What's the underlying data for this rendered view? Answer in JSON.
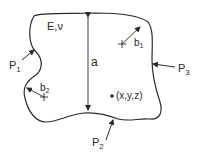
{
  "diagram": {
    "body": {
      "material_label": "E,ν",
      "dimension_label": "a"
    },
    "loads": [
      {
        "id": "P1",
        "label": "P",
        "subscript": "1"
      },
      {
        "id": "P2",
        "label": "P",
        "subscript": "2"
      },
      {
        "id": "P3",
        "label": "P",
        "subscript": "3"
      }
    ],
    "distances": [
      {
        "id": "b1",
        "label": "b",
        "subscript": "1"
      },
      {
        "id": "b2",
        "label": "b",
        "subscript": "2"
      }
    ],
    "point": {
      "label": "(x,y,z)"
    },
    "colors": {
      "stroke": "#2a2a2a",
      "background": "#ffffff"
    }
  }
}
